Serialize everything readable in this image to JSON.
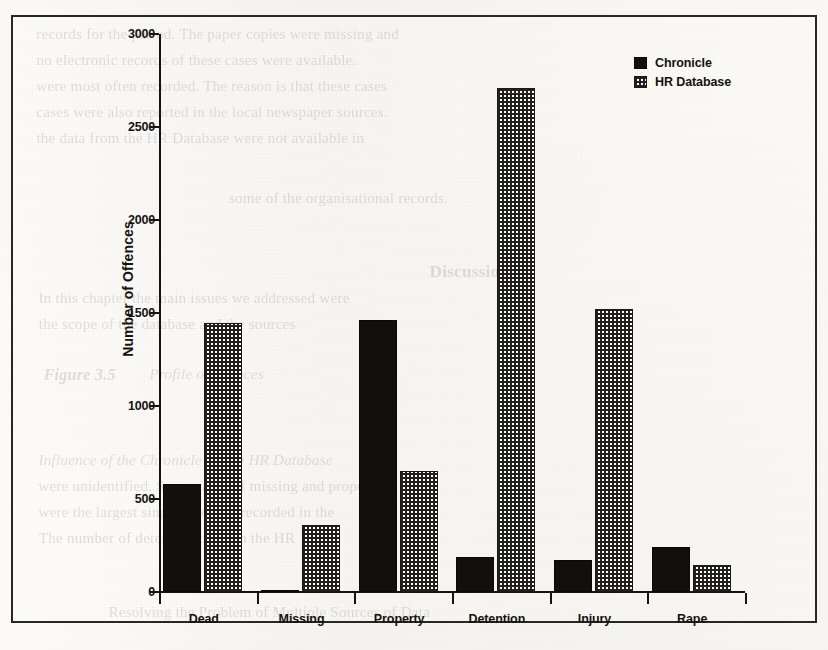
{
  "chart_data": {
    "type": "bar",
    "title": "",
    "xlabel": "",
    "ylabel": "Number of Offences",
    "categories": [
      "Dead",
      "Missing",
      "Property",
      "Detention",
      "Injury",
      "Rape"
    ],
    "series": [
      {
        "name": "Chronicle",
        "values": [
          580,
          10,
          1460,
          190,
          172,
          242
        ]
      },
      {
        "name": "HR Database",
        "values": [
          1445,
          360,
          650,
          2710,
          1520,
          145
        ]
      }
    ],
    "ylim": [
      0,
      3000
    ],
    "yticks": [
      0,
      500,
      1000,
      1500,
      2000,
      2500,
      3000
    ],
    "ytick_labels": [
      "0",
      "500",
      "1000",
      "1500",
      "2000",
      "2500",
      "3000"
    ],
    "grid": false,
    "legend_position": "top-right",
    "legend": [
      {
        "label": "Chronicle",
        "swatch": "solid-black"
      },
      {
        "label": "HR Database",
        "swatch": "checkerboard"
      }
    ]
  },
  "colors": {
    "chronicle": "#120f0c",
    "hr_database_ink": "#231f1b",
    "hr_database_ground": "#ffffff",
    "axis": "#15120f",
    "paper": "#fbf9f6",
    "frame": "#2a2723"
  },
  "page_bleed_through": {
    "note": "faint mirrored text showing through the scanned page",
    "lines": [
      {
        "text": "records for the period. The paper copies were missing and",
        "x": 38,
        "y": 26,
        "size": 15,
        "style": ""
      },
      {
        "text": "no electronic records of these cases were available.",
        "x": 38,
        "y": 52,
        "size": 15,
        "style": ""
      },
      {
        "text": "were most often recorded. The reason is that these cases",
        "x": 38,
        "y": 78,
        "size": 15,
        "style": ""
      },
      {
        "text": "cases were also reported in the local newspaper sources.",
        "x": 38,
        "y": 104,
        "size": 15,
        "style": ""
      },
      {
        "text": "the data from the HR Database were not available in",
        "x": 38,
        "y": 130,
        "size": 15,
        "style": ""
      },
      {
        "text": "some of the organisational records.",
        "x": 230,
        "y": 190,
        "size": 15,
        "style": ""
      },
      {
        "text": "Discussion",
        "x": 430,
        "y": 262,
        "size": 17,
        "style": "b"
      },
      {
        "text": "In this chapter the main issues we addressed were",
        "x": 40,
        "y": 290,
        "size": 15,
        "style": ""
      },
      {
        "text": "the scope of the database and the sources",
        "x": 40,
        "y": 316,
        "size": 15,
        "style": ""
      },
      {
        "text": "Figure 3.5",
        "x": 44,
        "y": 366,
        "size": 16,
        "style": "bi"
      },
      {
        "text": "Profile of offences",
        "x": 150,
        "y": 366,
        "size": 15,
        "style": "i"
      },
      {
        "text": "Influence of the Chronicle on the HR Database",
        "x": 40,
        "y": 452,
        "size": 15,
        "style": "i"
      },
      {
        "text": "were unidentified. Some cases of missing and property",
        "x": 40,
        "y": 478,
        "size": 15,
        "style": ""
      },
      {
        "text": "were the largest single category recorded in the",
        "x": 40,
        "y": 504,
        "size": 15,
        "style": ""
      },
      {
        "text": "The number of detention cases in the HR",
        "x": 40,
        "y": 530,
        "size": 15,
        "style": ""
      },
      {
        "text": "Resolving the Problem of Multiple Sources of Data",
        "x": 110,
        "y": 604,
        "size": 15,
        "style": ""
      }
    ]
  }
}
